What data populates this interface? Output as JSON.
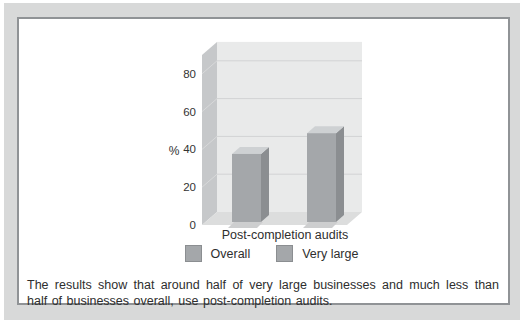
{
  "caption": {
    "text": "The results show that around half of very large businesses and much less than half of businesses overall, use post-completion audits."
  },
  "chart_data": {
    "type": "bar",
    "style": "3d-column",
    "categories": [
      "Post-completion audits"
    ],
    "series": [
      {
        "name": "Overall",
        "values": [
          36
        ],
        "color": "#a4a7aa"
      },
      {
        "name": "Very large",
        "values": [
          47
        ],
        "color": "#a4a7aa"
      }
    ],
    "xlabel": "Post-completion audits",
    "ylabel": "%",
    "yticks": [
      0,
      20,
      40,
      60,
      80
    ],
    "ylim": [
      0,
      90
    ],
    "grid": "horizontal",
    "legend_position": "bottom",
    "colors": {
      "bar_front": "#a4a7aa",
      "bar_side": "#8b8e91",
      "bar_top": "#ced1d3",
      "bar_shadow": "#cdcecf",
      "wall_back": "#e9eaea",
      "wall_left": "#c6c8ca",
      "floor": "#dcdddd",
      "gridline": "#d2d3d4",
      "tick_diag": "#d8d9da",
      "text": "#2e2e2e",
      "axis_text": "#333333"
    }
  }
}
